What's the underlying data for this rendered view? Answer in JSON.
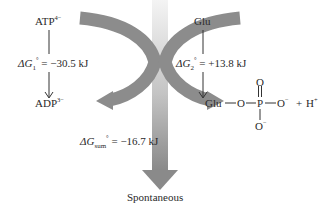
{
  "diagram": {
    "left_reaction": {
      "reactant": "ATP",
      "reactant_charge": "4−",
      "product": "ADP",
      "product_charge": "3−",
      "dg_prefix": "ΔG",
      "dg_sub": "1",
      "dg_sup": "°",
      "dg_value": "= −30.5 kJ"
    },
    "right_reaction": {
      "reactant": "Glu",
      "dg_prefix": "ΔG",
      "dg_sub": "2",
      "dg_sup": "°",
      "dg_value": "= +13.8 kJ",
      "product": {
        "glu": "Glu",
        "o1": "O",
        "p": "P",
        "o_top": "O",
        "o_right": "O",
        "o_right_charge": "−",
        "o_bottom": "O",
        "o_bottom_charge": "−",
        "plus": "+",
        "h": "H",
        "h_charge": "+"
      }
    },
    "sum": {
      "dg_prefix": "ΔG",
      "dg_sub": "sum",
      "dg_sup": "°",
      "dg_value": "= −16.7 kJ"
    },
    "outcome_label": "Spontaneous",
    "colors": {
      "arc_arrow": "#8c8c8c",
      "down_arrow_top": "#f2f2f2",
      "down_arrow_bottom": "#8a8a8a",
      "text": "#2a2a2a"
    }
  }
}
